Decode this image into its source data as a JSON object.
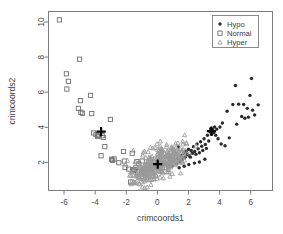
{
  "figure": {
    "background_color": "#ffffff",
    "frame_color": "#7c7c7c",
    "width": 283,
    "height": 234
  },
  "chart_data": {
    "type": "scatter",
    "title": "",
    "xlabel": "crimcoords1",
    "ylabel": "crimcoords2",
    "xlim": [
      -7.0,
      7.4
    ],
    "ylim": [
      0.4,
      10.6
    ],
    "xticks": [
      -6,
      -4,
      -2,
      0,
      2,
      4,
      6
    ],
    "xticklabels": [
      "-6",
      "-4",
      "-2",
      "0",
      "2",
      "4",
      "6"
    ],
    "yticks": [
      2,
      4,
      6,
      8,
      10
    ],
    "yticklabels": [
      "2",
      "4",
      "6",
      "8",
      "10"
    ],
    "grid": false,
    "legend": {
      "position": "top-right",
      "entries": [
        {
          "label": "Hypo",
          "marker": "filled-circle",
          "color": "#2b2b2b"
        },
        {
          "label": "Normal",
          "marker": "open-square",
          "color": "#6e6e6e"
        },
        {
          "label": "Hyper",
          "marker": "triangle",
          "color": "#9a9a9a"
        }
      ]
    },
    "series": [
      {
        "name": "Hypo",
        "marker": "filled-circle",
        "color": "#2b2b2b",
        "points": [
          [
            1.32,
            2.22
          ],
          [
            1.45,
            2.05
          ],
          [
            1.52,
            2.38
          ],
          [
            1.62,
            2.18
          ],
          [
            1.7,
            2.52
          ],
          [
            1.78,
            2.3
          ],
          [
            1.85,
            2.62
          ],
          [
            1.92,
            2.44
          ],
          [
            2.0,
            2.75
          ],
          [
            2.05,
            2.4
          ],
          [
            2.12,
            2.3
          ],
          [
            2.18,
            2.68
          ],
          [
            2.25,
            2.52
          ],
          [
            2.32,
            2.9
          ],
          [
            2.4,
            2.62
          ],
          [
            2.48,
            2.46
          ],
          [
            2.55,
            3.05
          ],
          [
            2.62,
            2.78
          ],
          [
            2.7,
            2.55
          ],
          [
            2.78,
            3.18
          ],
          [
            2.85,
            2.92
          ],
          [
            2.92,
            2.68
          ],
          [
            3.0,
            3.35
          ],
          [
            3.08,
            3.02
          ],
          [
            3.15,
            2.8
          ],
          [
            3.22,
            3.55
          ],
          [
            3.3,
            3.22
          ],
          [
            3.38,
            3.75
          ],
          [
            3.42,
            3.92
          ],
          [
            3.48,
            3.6
          ],
          [
            3.55,
            3.88
          ],
          [
            3.62,
            3.7
          ],
          [
            3.68,
            4.02
          ],
          [
            3.75,
            3.55
          ],
          [
            3.82,
            3.9
          ],
          [
            3.9,
            3.35
          ],
          [
            4.02,
            4.02
          ],
          [
            4.1,
            3.05
          ],
          [
            4.18,
            4.25
          ],
          [
            4.35,
            2.95
          ],
          [
            4.48,
            4.92
          ],
          [
            4.62,
            3.4
          ],
          [
            4.85,
            5.3
          ],
          [
            5.02,
            6.38
          ],
          [
            5.1,
            4.18
          ],
          [
            5.22,
            5.32
          ],
          [
            5.42,
            4.62
          ],
          [
            5.55,
            5.3
          ],
          [
            5.62,
            4.52
          ],
          [
            5.78,
            5.08
          ],
          [
            5.85,
            4.58
          ],
          [
            5.95,
            5.82
          ],
          [
            6.05,
            6.78
          ],
          [
            6.12,
            4.98
          ],
          [
            6.25,
            4.7
          ],
          [
            6.48,
            5.28
          ],
          [
            3.05,
            2.18
          ],
          [
            2.7,
            2.02
          ],
          [
            2.38,
            1.96
          ],
          [
            2.02,
            1.88
          ],
          [
            1.72,
            1.78
          ],
          [
            1.4,
            1.7
          ],
          [
            1.22,
            1.92
          ],
          [
            1.1,
            2.08
          ],
          [
            0.95,
            1.8
          ],
          [
            1.18,
            2.5
          ],
          [
            1.35,
            2.88
          ]
        ],
        "centroid": [
          3.48,
          3.78
        ]
      },
      {
        "name": "Normal",
        "marker": "open-square",
        "color": "#6e6e6e",
        "points": [
          [
            -6.3,
            10.12
          ],
          [
            -5.85,
            7.05
          ],
          [
            -5.72,
            6.62
          ],
          [
            -5.82,
            6.18
          ],
          [
            -5.0,
            7.88
          ],
          [
            -4.95,
            5.52
          ],
          [
            -5.08,
            5.08
          ],
          [
            -4.92,
            4.86
          ],
          [
            -4.82,
            4.8
          ],
          [
            -4.3,
            5.82
          ],
          [
            -4.22,
            4.78
          ],
          [
            -4.1,
            3.68
          ],
          [
            -3.95,
            3.58
          ],
          [
            -3.85,
            3.48
          ],
          [
            -3.55,
            3.52
          ],
          [
            -3.48,
            3.42
          ],
          [
            -3.02,
            4.45
          ],
          [
            -3.38,
            2.9
          ],
          [
            -2.95,
            2.18
          ],
          [
            -2.88,
            2.12
          ],
          [
            -2.78,
            2.2
          ],
          [
            -3.62,
            2.38
          ],
          [
            -2.18,
            2.62
          ],
          [
            -2.12,
            2.08
          ],
          [
            -2.08,
            1.72
          ],
          [
            -1.85,
            1.62
          ],
          [
            -1.72,
            0.88
          ],
          [
            -1.58,
            1.52
          ],
          [
            -1.52,
            1.6
          ],
          [
            -1.45,
            1.58
          ],
          [
            -1.38,
            1.7
          ],
          [
            -1.32,
            2.05
          ],
          [
            -1.28,
            1.45
          ],
          [
            -1.2,
            1.92
          ],
          [
            -0.98,
            2.08
          ],
          [
            -0.92,
            1.48
          ],
          [
            -0.85,
            1.65
          ],
          [
            -1.62,
            2.52
          ],
          [
            -2.48,
            1.98
          ],
          [
            -3.78,
            3.55
          ]
        ],
        "centroid": [
          -3.62,
          3.75
        ]
      },
      {
        "name": "Hyper",
        "marker": "triangle",
        "color": "#9a9a9a",
        "cluster_center": [
          0.05,
          1.92
        ],
        "cluster_spread": [
          0.78,
          0.42
        ],
        "n_points": 330,
        "centroid": [
          0.02,
          1.9
        ],
        "outlier_points": [
          [
            -1.55,
            2.68
          ],
          [
            -0.82,
            2.62
          ],
          [
            -0.45,
            2.85
          ],
          [
            0.3,
            2.72
          ],
          [
            0.62,
            2.62
          ],
          [
            1.05,
            2.52
          ],
          [
            1.25,
            2.3
          ],
          [
            -1.18,
            1.18
          ],
          [
            -0.68,
            1.12
          ],
          [
            -0.25,
            1.05
          ],
          [
            0.38,
            1.1
          ],
          [
            0.95,
            1.35
          ],
          [
            1.48,
            2.05
          ],
          [
            1.62,
            2.3
          ],
          [
            -1.92,
            2.1
          ],
          [
            -2.05,
            1.88
          ]
        ]
      }
    ],
    "centroid_marker": {
      "symbol": "plus-cross",
      "color": "#000000",
      "description": "Group centroid crosses drawn for each class"
    }
  }
}
